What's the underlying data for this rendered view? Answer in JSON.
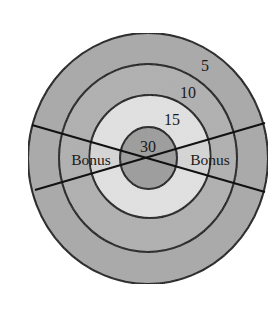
{
  "diagram": {
    "type": "target-dartboard",
    "center": [
      148,
      158
    ],
    "rings": [
      {
        "name": "outer-ring",
        "points": "5",
        "rx": 120,
        "ry": 125,
        "color": "#a9a9a9"
      },
      {
        "name": "ring-10",
        "points": "10",
        "rx": 89,
        "ry": 94,
        "color": "#b1b1b1"
      },
      {
        "name": "ring-15",
        "points": "15",
        "rx": 61,
        "ry": 61.5,
        "color": "#e2e2e2"
      },
      {
        "name": "bullseye",
        "points": "30",
        "rx": 28.5,
        "ry": 31,
        "color": "#9c9c9c"
      }
    ],
    "wedge_lines": [
      {
        "from": [
          32,
          125
        ],
        "to": [
          265,
          192
        ]
      },
      {
        "from": [
          35,
          190
        ],
        "to": [
          265,
          123
        ]
      }
    ],
    "wedge_fill_ring15": "#d2d2d2",
    "labels": {
      "ring5": "5",
      "ring10": "10",
      "ring15": "15",
      "center": "30",
      "bonus_left": "Bonus",
      "bonus_right": "Bonus"
    },
    "stroke_color": "#111111"
  }
}
